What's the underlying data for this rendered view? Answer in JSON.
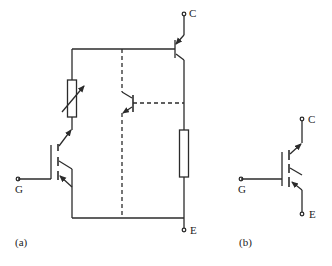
{
  "colors": {
    "line": "#2b2b2b",
    "background": "#ffffff"
  },
  "figure_a": {
    "caption": "(a)",
    "terminals": {
      "collector": "C",
      "gate": "G",
      "emitter": "E"
    },
    "components": [
      {
        "type": "pnp-transistor",
        "role": "main-transistor"
      },
      {
        "type": "variable-resistor",
        "role": "modulated-resistance"
      },
      {
        "type": "resistor",
        "role": "emitter-resistor"
      },
      {
        "type": "parasitic-npn-transistor",
        "role": "parasitic",
        "connection": "dashed"
      },
      {
        "type": "mosfet-igbt",
        "role": "input-mosfet"
      }
    ]
  },
  "figure_b": {
    "caption": "(b)",
    "terminals": {
      "collector": "C",
      "gate": "G",
      "emitter": "E"
    },
    "components": [
      {
        "type": "igbt-symbol",
        "role": "circuit-symbol"
      }
    ]
  }
}
